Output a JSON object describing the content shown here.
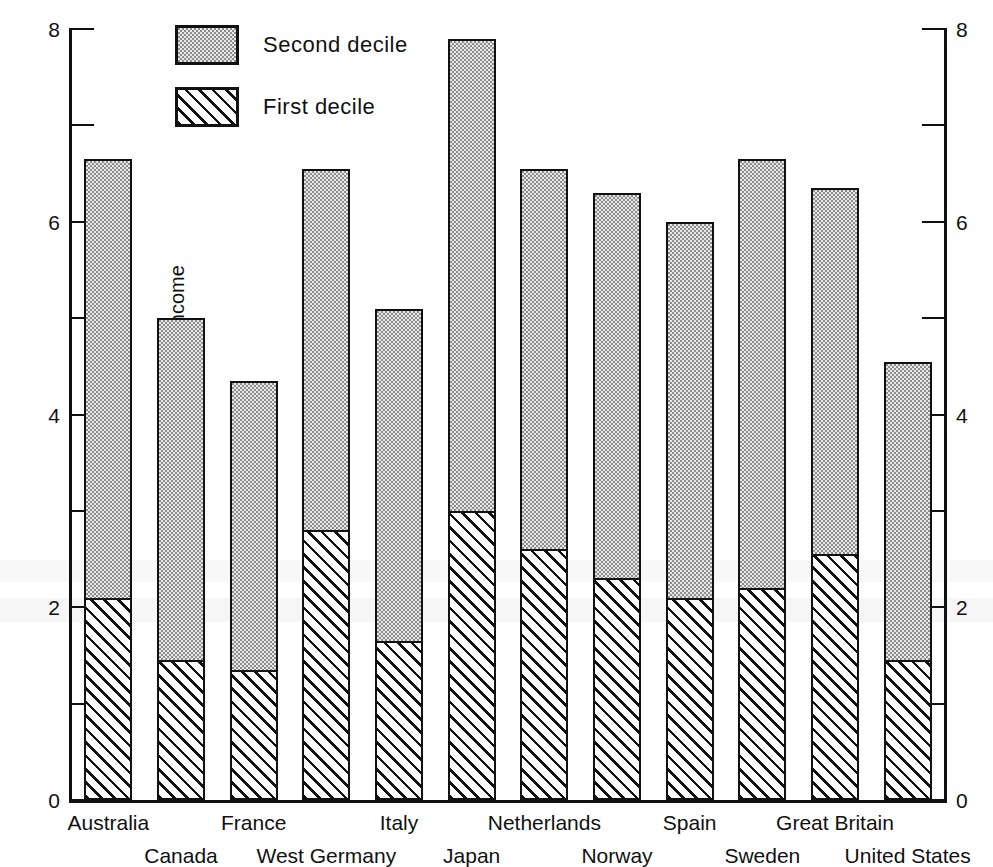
{
  "chart_data": {
    "type": "bar",
    "subtype": "stacked-vertical",
    "title": "",
    "xlabel": "",
    "ylabel": "Percentage of total household income",
    "ylim": [
      0,
      8
    ],
    "yticks_major": [
      0,
      2,
      4,
      6,
      8
    ],
    "yticks_minor": [
      1,
      3,
      5,
      7
    ],
    "grid": false,
    "axes": [
      "left",
      "right"
    ],
    "right_axis_mirrors_left": true,
    "legend_position": "top-left-inside",
    "categories": [
      "Australia",
      "Canada",
      "France",
      "West Germany",
      "Italy",
      "Japan",
      "Netherlands",
      "Norway",
      "Spain",
      "Sweden",
      "Great Britain",
      "United States"
    ],
    "series": [
      {
        "name": "First decile",
        "pattern": "diagonal-hatch",
        "values": [
          2.1,
          1.45,
          1.35,
          2.8,
          1.65,
          3.0,
          2.6,
          2.3,
          2.1,
          2.2,
          2.55,
          1.45
        ]
      },
      {
        "name": "Second decile",
        "pattern": "stipple-dots",
        "values": [
          4.55,
          3.55,
          3.0,
          3.75,
          3.45,
          4.9,
          3.95,
          4.0,
          3.9,
          4.45,
          3.8,
          3.1
        ]
      }
    ],
    "totals": [
      6.65,
      5.0,
      4.35,
      6.55,
      5.1,
      7.9,
      6.55,
      6.3,
      6.0,
      6.65,
      6.35,
      4.55
    ]
  },
  "legend": {
    "items": [
      {
        "label": "Second decile",
        "pattern": "stipple-dots"
      },
      {
        "label": "First decile",
        "pattern": "diagonal-hatch"
      }
    ]
  },
  "axis": {
    "y_title": "Percentage of total household income",
    "labels": {
      "t0": "0",
      "t2": "2",
      "t4": "4",
      "t6": "6",
      "t8": "8"
    }
  },
  "xaxis": {
    "labels": [
      {
        "text": "Australia",
        "row": "top"
      },
      {
        "text": "Canada",
        "row": "bottom"
      },
      {
        "text": "France",
        "row": "top"
      },
      {
        "text": "West Germany",
        "row": "bottom"
      },
      {
        "text": "Italy",
        "row": "top"
      },
      {
        "text": "Japan",
        "row": "bottom"
      },
      {
        "text": "Netherlands",
        "row": "top"
      },
      {
        "text": "Norway",
        "row": "bottom"
      },
      {
        "text": "Spain",
        "row": "top"
      },
      {
        "text": "Sweden",
        "row": "bottom"
      },
      {
        "text": "Great Britain",
        "row": "top"
      },
      {
        "text": "United States",
        "row": "bottom"
      }
    ]
  },
  "colors": {
    "ink": "#111111",
    "paper": "#ffffff",
    "second_decile_fill": "#e8e8e8",
    "first_decile_fill": "#f2f2f2"
  }
}
